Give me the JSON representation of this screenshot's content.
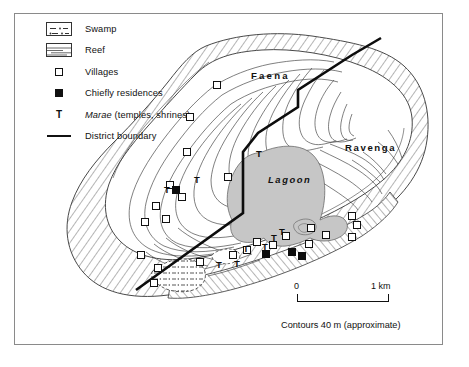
{
  "figure": {
    "kind": "map",
    "frame_border_color": "#8a8a8a"
  },
  "legend": {
    "items": [
      {
        "key": "swamp-swatch",
        "label": "Swamp"
      },
      {
        "key": "reef-swatch",
        "label": "Reef"
      },
      {
        "key": "open-square",
        "label": "Villages"
      },
      {
        "key": "filled-square",
        "label": "Chiefly residences"
      },
      {
        "key": "t-glyph",
        "label_italic": "Marae",
        "label_rest": " (temples, shrines)"
      },
      {
        "key": "thick-line",
        "label": "District boundary"
      }
    ]
  },
  "map": {
    "labels": {
      "faena": "Faena",
      "ravenga": "Ravenga",
      "lagoon": "Lagoon"
    },
    "colors": {
      "lagoon_fill": "#c6c6c6",
      "land_fill": "#ffffff",
      "ink": "#111111",
      "contour": "#333333",
      "reef_hatch": "#555555"
    },
    "villages": [
      {
        "x": 213,
        "y": 81
      },
      {
        "x": 186,
        "y": 113
      },
      {
        "x": 224,
        "y": 173
      },
      {
        "x": 183,
        "y": 148
      },
      {
        "x": 166,
        "y": 181
      },
      {
        "x": 178,
        "y": 193
      },
      {
        "x": 152,
        "y": 202
      },
      {
        "x": 162,
        "y": 215
      },
      {
        "x": 141,
        "y": 218
      },
      {
        "x": 137,
        "y": 251
      },
      {
        "x": 154,
        "y": 264
      },
      {
        "x": 196,
        "y": 258
      },
      {
        "x": 150,
        "y": 279
      },
      {
        "x": 229,
        "y": 251
      },
      {
        "x": 243,
        "y": 246
      },
      {
        "x": 253,
        "y": 238
      },
      {
        "x": 269,
        "y": 241
      },
      {
        "x": 282,
        "y": 232
      },
      {
        "x": 305,
        "y": 240
      },
      {
        "x": 307,
        "y": 224
      },
      {
        "x": 322,
        "y": 231
      },
      {
        "x": 348,
        "y": 212
      },
      {
        "x": 353,
        "y": 221
      },
      {
        "x": 348,
        "y": 233
      }
    ],
    "chiefly_residences": [
      {
        "x": 172,
        "y": 186
      },
      {
        "x": 262,
        "y": 250
      },
      {
        "x": 288,
        "y": 248
      },
      {
        "x": 298,
        "y": 252
      }
    ],
    "marae": [
      {
        "x": 194,
        "y": 176
      },
      {
        "x": 256,
        "y": 150
      },
      {
        "x": 164,
        "y": 186
      },
      {
        "x": 216,
        "y": 261
      },
      {
        "x": 234,
        "y": 260
      },
      {
        "x": 243,
        "y": 245
      },
      {
        "x": 262,
        "y": 243
      },
      {
        "x": 271,
        "y": 234
      },
      {
        "x": 279,
        "y": 228
      }
    ]
  },
  "scale": {
    "zero": "0",
    "max": "1 km"
  },
  "caption": {
    "contours": "Contours 40 m (approximate)"
  }
}
